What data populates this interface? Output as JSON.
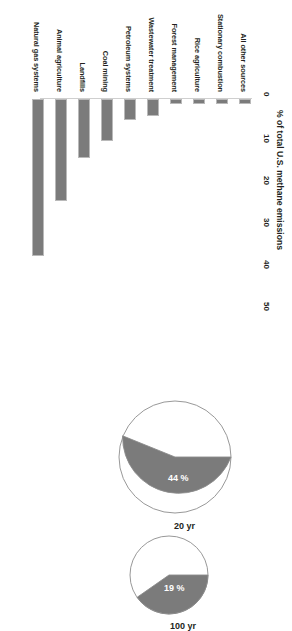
{
  "chart_data": [
    {
      "type": "bar",
      "title": "",
      "xlabel": "",
      "ylabel": "% of total U.S. methane emissions",
      "orientation": "vertical",
      "ylim": [
        0,
        50
      ],
      "yticks": [
        "0",
        "10",
        "20",
        "30",
        "40",
        "50"
      ],
      "grid": false,
      "legend": "none",
      "bar_color": "#7b7b7b",
      "categories": [
        "All other sources",
        "Stationary combustion",
        "Rice agriculture",
        "Forest management",
        "Wastewater treatment",
        "Petroleum systems",
        "Coal mining",
        "Landfills",
        "Animal agriculture",
        "Natural gas systems"
      ],
      "values": [
        1,
        1,
        1,
        1,
        4,
        5,
        10,
        14,
        24,
        37
      ]
    },
    {
      "type": "pie",
      "title": "20 yr",
      "labels": [
        "methane share",
        "other"
      ],
      "values": [
        44,
        56
      ],
      "value_labels": [
        "44 %",
        ""
      ],
      "colors": [
        "#7b7b7b",
        "#ffffff"
      ],
      "legend": "none"
    },
    {
      "type": "pie",
      "title": "100 yr",
      "labels": [
        "methane share",
        "other"
      ],
      "values": [
        19,
        81
      ],
      "value_labels": [
        "19 %",
        ""
      ],
      "colors": [
        "#7b7b7b",
        "#ffffff"
      ],
      "legend": "none"
    }
  ],
  "bar_chart": {
    "axis_title": "% of total U.S. methane emissions",
    "ticks": [
      {
        "label": "0"
      },
      {
        "label": "10"
      },
      {
        "label": "20"
      },
      {
        "label": "30"
      },
      {
        "label": "40"
      },
      {
        "label": "50"
      }
    ],
    "bars": [
      {
        "label": "All other sources"
      },
      {
        "label": "Stationary combustion"
      },
      {
        "label": "Rice agriculture"
      },
      {
        "label": "Forest management"
      },
      {
        "label": "Wastewater treatment"
      },
      {
        "label": "Petroleum systems"
      },
      {
        "label": "Coal mining"
      },
      {
        "label": "Landfills"
      },
      {
        "label": "Animal agriculture"
      },
      {
        "label": "Natural gas systems"
      }
    ]
  },
  "pies": [
    {
      "title": "20 yr",
      "slice_label": "44 %"
    },
    {
      "title": "100 yr",
      "slice_label": "19 %"
    }
  ]
}
